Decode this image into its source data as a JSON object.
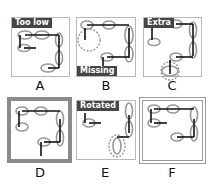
{
  "panels": [
    {
      "letter": "A",
      "tag": "Too low"
    },
    {
      "letter": "B",
      "tag": "Missing"
    },
    {
      "letter": "C",
      "tag": "Extra"
    },
    {
      "letter": "D",
      "tag": ""
    },
    {
      "letter": "E",
      "tag": "Rotated"
    },
    {
      "letter": "F",
      "tag": ""
    }
  ],
  "colors": {
    "link": "#888888",
    "bar": "#111111",
    "tag_bg": "#454545",
    "dashed": "#999999"
  }
}
